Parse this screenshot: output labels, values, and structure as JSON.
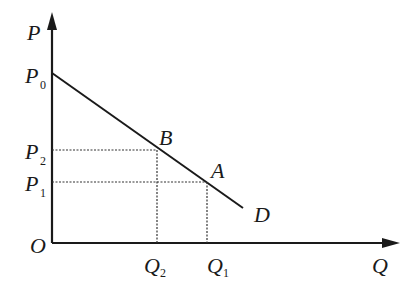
{
  "diagram": {
    "type": "demand-curve",
    "axes": {
      "y_label": "P",
      "x_label": "Q",
      "origin_label": "O"
    },
    "price_labels": [
      {
        "base": "P",
        "sub": "0"
      },
      {
        "base": "P",
        "sub": "2"
      },
      {
        "base": "P",
        "sub": "1"
      }
    ],
    "quantity_labels": [
      {
        "base": "Q",
        "sub": "2"
      },
      {
        "base": "Q",
        "sub": "1"
      }
    ],
    "points": [
      {
        "label": "B"
      },
      {
        "label": "A"
      }
    ],
    "curve_label": "D",
    "colors": {
      "line": "#1a1a1a",
      "dotted": "#333333",
      "background": "#ffffff"
    }
  }
}
